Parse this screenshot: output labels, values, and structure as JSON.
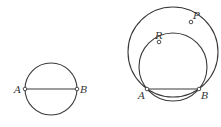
{
  "figure_left": {
    "points": {
      "A": {
        "label": "A",
        "x": 25,
        "y": 89
      },
      "B": {
        "label": "B",
        "x": 77,
        "y": 89
      }
    },
    "circle": {
      "cx": 51,
      "cy": 89,
      "r": 26
    },
    "segment": [
      "A",
      "B"
    ]
  },
  "figure_right": {
    "points": {
      "A": {
        "label": "A",
        "x": 147,
        "y": 89
      },
      "B": {
        "label": "B",
        "x": 199,
        "y": 89
      },
      "P": {
        "label": "P",
        "x": 191,
        "y": 22
      },
      "R": {
        "label": "R",
        "x": 159,
        "y": 42
      }
    },
    "outer_circle": {
      "through": [
        "A",
        "B",
        "P"
      ]
    },
    "inner_circle": {
      "through": [
        "A",
        "B",
        "R"
      ]
    },
    "segment": [
      "A",
      "B"
    ]
  },
  "colors": {
    "stroke": "#3a3a3a",
    "background": "#ffffff"
  }
}
